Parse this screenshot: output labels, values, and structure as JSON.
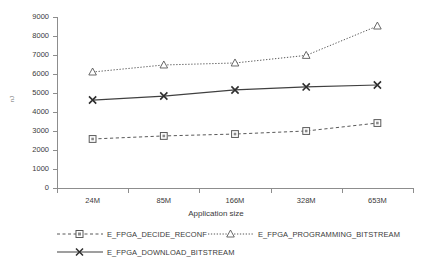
{
  "chart_data": {
    "type": "line",
    "title": "",
    "xlabel": "Application size",
    "ylabel": "nJ",
    "categories": [
      "24M",
      "85M",
      "166M",
      "328M",
      "653M"
    ],
    "ylim": [
      0,
      9000
    ],
    "yticks": [
      0,
      1000,
      2000,
      3000,
      4000,
      5000,
      6000,
      7000,
      8000,
      9000
    ],
    "grid": false,
    "legend_position": "bottom",
    "series": [
      {
        "name": "E_FPGA_DECIDE_RECONF",
        "values": [
          2580,
          2740,
          2840,
          3000,
          3420
        ],
        "marker": "square",
        "line_style": "dashed",
        "color": "#595959"
      },
      {
        "name": "E_FPGA_PROGRAMMING_BITSTREAM",
        "values": [
          6105,
          6475,
          6580,
          6980,
          8525
        ],
        "marker": "triangle",
        "line_style": "dotted",
        "color": "#595959"
      },
      {
        "name": "E_FPGA_DOWNLOAD_BITSTREAM",
        "values": [
          4630,
          4840,
          5160,
          5320,
          5420
        ],
        "marker": "x",
        "line_style": "solid",
        "color": "#404040"
      }
    ]
  },
  "axis": {
    "y_label": "nJ",
    "x_label": "Application size",
    "y_tick_labels": [
      "9000",
      "8000",
      "7000",
      "6000",
      "5000",
      "4000",
      "3000",
      "2000",
      "1000",
      "0"
    ],
    "x_tick_labels": [
      "24M",
      "85M",
      "166M",
      "328M",
      "653M"
    ]
  },
  "legend": {
    "items": [
      {
        "label": "E_FPGA_DECIDE_RECONF"
      },
      {
        "label": "E_FPGA_PROGRAMMING_BITSTREAM"
      },
      {
        "label": "E_FPGA_DOWNLOAD_BITSTREAM"
      }
    ]
  }
}
